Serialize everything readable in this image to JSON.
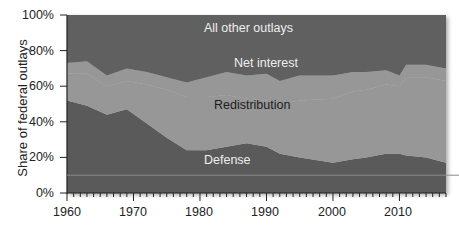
{
  "chart_data": {
    "type": "area",
    "stacked": true,
    "normalized": true,
    "title": "",
    "xlabel": "",
    "ylabel": "Share of federal outlays",
    "ylim": [
      0,
      100
    ],
    "xlim": [
      1960,
      2017
    ],
    "y_ticks": [
      "0%",
      "20%",
      "40%",
      "60%",
      "80%",
      "100%"
    ],
    "x_ticks": [
      "1960",
      "1970",
      "1980",
      "1990",
      "2000",
      "2010"
    ],
    "grid": false,
    "legend": "inline labels",
    "x": [
      1960,
      1963,
      1966,
      1969,
      1972,
      1975,
      1978,
      1981,
      1984,
      1987,
      1990,
      1992,
      1995,
      2000,
      2003,
      2005,
      2008,
      2010,
      2011,
      2014,
      2017
    ],
    "series": [
      {
        "name": "Defense",
        "color": "#5a5a5a",
        "values": [
          52,
          49,
          44,
          47,
          39,
          31,
          24,
          24,
          26,
          28,
          26,
          22,
          20,
          17,
          19,
          20,
          22,
          22,
          21,
          20,
          17
        ]
      },
      {
        "name": "Redistribution",
        "color": "#979797",
        "values": [
          15,
          18,
          16,
          16,
          22,
          27,
          30,
          30,
          29,
          25,
          26,
          28,
          32,
          36,
          38,
          38,
          39,
          38,
          44,
          45,
          46
        ]
      },
      {
        "name": "Net interest",
        "color": "#979797",
        "values": [
          6,
          7,
          6,
          7,
          7,
          7,
          8,
          11,
          13,
          13,
          15,
          13,
          14,
          13,
          11,
          10,
          8,
          6,
          7,
          7,
          7
        ]
      },
      {
        "name": "All other outlays",
        "color": "#606060",
        "values": [
          27,
          26,
          34,
          30,
          32,
          35,
          38,
          35,
          32,
          34,
          33,
          37,
          34,
          34,
          32,
          32,
          31,
          34,
          28,
          28,
          30
        ]
      }
    ],
    "annotations": [
      {
        "text": "All other outlays",
        "x": 1985,
        "y": 90
      },
      {
        "text": "Net interest",
        "x": 1988,
        "y": 75
      },
      {
        "text": "Redistribution",
        "x": 1986,
        "y": 50
      },
      {
        "text": "Defense",
        "x": 1985,
        "y": 16
      }
    ],
    "reference_line": {
      "y": 10,
      "color": "#8a8a8a"
    }
  },
  "axis": {
    "ylabel": "Share of federal outlays",
    "yticks": [
      "100%",
      "80%",
      "60%",
      "40%",
      "20%",
      "0%"
    ],
    "xticks": [
      "1960",
      "1970",
      "1980",
      "1990",
      "2000",
      "2010"
    ]
  },
  "labels": {
    "all_other": "All other outlays",
    "net_interest": "Net interest",
    "redistribution": "Redistribution",
    "defense": "Defense"
  },
  "colors": {
    "dark": "#5b5b5b",
    "light": "#989898",
    "axis": "#222222"
  }
}
